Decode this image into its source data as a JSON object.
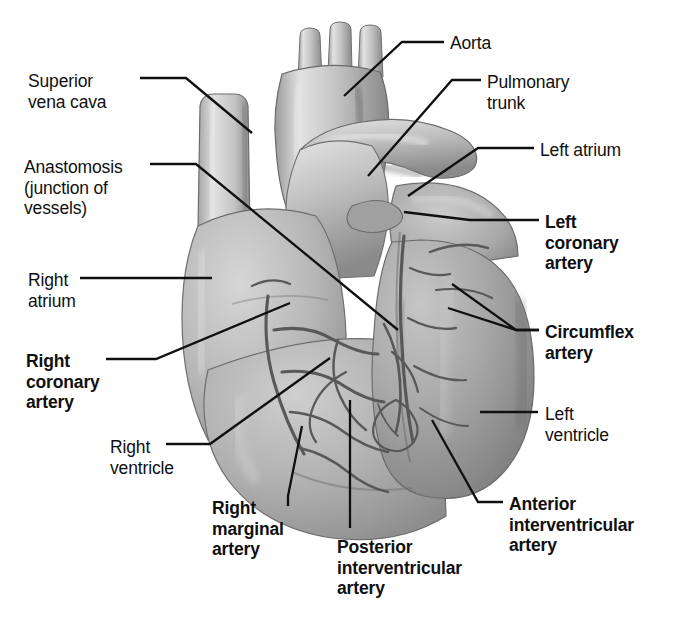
{
  "figure": {
    "style": {
      "background": "#ffffff",
      "ink": "#101010",
      "tissue_light": "#d8d8d8",
      "tissue_mid": "#b4b4b4",
      "tissue_dark": "#8e8e8e",
      "tissue_shadow": "#6e6e6e",
      "vessel": "#5a5a5a"
    }
  },
  "labels": [
    {
      "id": "superior-vena-cava",
      "text": "Superior\nvena cava",
      "bold": false,
      "align": "left",
      "x": 28,
      "y": 71
    },
    {
      "id": "anastomosis",
      "text": "Anastomosis\n(junction of\nvessels)",
      "bold": false,
      "align": "left",
      "x": 24,
      "y": 157
    },
    {
      "id": "right-atrium",
      "text": "Right\natrium",
      "bold": false,
      "align": "left",
      "x": 28,
      "y": 270
    },
    {
      "id": "right-coronary-artery",
      "text": "Right\ncoronary\nartery",
      "bold": true,
      "align": "left",
      "x": 26,
      "y": 351
    },
    {
      "id": "right-ventricle",
      "text": "Right\nventricle",
      "bold": false,
      "align": "left",
      "x": 110,
      "y": 437
    },
    {
      "id": "right-marginal-artery",
      "text": "Right\nmarginal\nartery",
      "bold": true,
      "align": "left",
      "x": 212,
      "y": 498
    },
    {
      "id": "posterior-interventricular-artery",
      "text": "Posterior\ninterventricular\nartery",
      "bold": true,
      "align": "left",
      "x": 337,
      "y": 537
    },
    {
      "id": "aorta",
      "text": "Aorta",
      "bold": false,
      "align": "left",
      "x": 450,
      "y": 33
    },
    {
      "id": "pulmonary-trunk",
      "text": "Pulmonary\ntrunk",
      "bold": false,
      "align": "left",
      "x": 487,
      "y": 72
    },
    {
      "id": "left-atrium",
      "text": "Left atrium",
      "bold": false,
      "align": "left",
      "x": 540,
      "y": 140
    },
    {
      "id": "left-coronary-artery",
      "text": "Left\ncoronary\nartery",
      "bold": true,
      "align": "left",
      "x": 545,
      "y": 212
    },
    {
      "id": "circumflex-artery",
      "text": "Circumflex\nartery",
      "bold": true,
      "align": "left",
      "x": 545,
      "y": 322
    },
    {
      "id": "left-ventricle",
      "text": "Left\nventricle",
      "bold": false,
      "align": "left",
      "x": 545,
      "y": 404
    },
    {
      "id": "anterior-interventricular-artery",
      "text": "Anterior\ninterventricular\nartery",
      "bold": true,
      "align": "left",
      "x": 509,
      "y": 494
    }
  ],
  "structures": [
    "aortic arch",
    "brachiocephalic branches",
    "superior vena cava",
    "pulmonary trunk",
    "left atrium / auricle",
    "right atrium",
    "right ventricle",
    "left ventricle",
    "right coronary artery",
    "left coronary artery",
    "circumflex artery",
    "right marginal artery",
    "anterior interventricular artery",
    "posterior interventricular artery",
    "coronary anastomosis"
  ]
}
